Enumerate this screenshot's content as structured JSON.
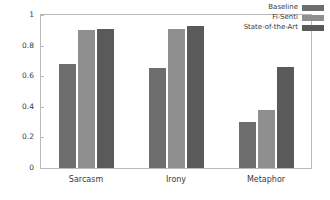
{
  "chart_data": {
    "type": "bar",
    "title": "",
    "xlabel": "",
    "ylabel": "",
    "categories": [
      "Sarcasm",
      "Irony",
      "Metaphor"
    ],
    "series": [
      {
        "name": "Baseline",
        "values": [
          0.68,
          0.655,
          0.3
        ],
        "color": "#6e6e6e"
      },
      {
        "name": "Fi-Senti",
        "values": [
          0.9,
          0.91,
          0.38
        ],
        "color": "#8f8f8f"
      },
      {
        "name": "State-of-the-Art",
        "values": [
          0.91,
          0.925,
          0.66
        ],
        "color": "#5a5a5a"
      }
    ],
    "ylim": [
      0,
      1
    ],
    "ytick_labels": [
      "0",
      "0.2",
      "0.4",
      "0.6",
      "0.8",
      "1"
    ],
    "ytick_values": [
      0,
      0.2,
      0.4,
      0.6,
      0.8,
      1
    ],
    "grid": false,
    "legend_position": "top-right",
    "frame_color": "#b9b9b9",
    "background": "#ffffff"
  }
}
